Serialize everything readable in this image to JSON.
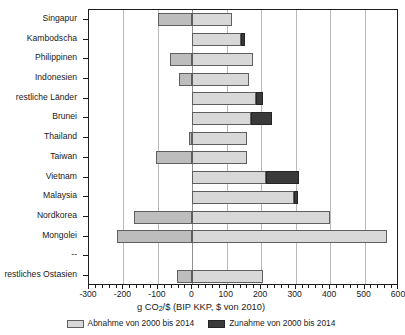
{
  "chart_data": {
    "type": "bar",
    "orientation": "horizontal",
    "title": "",
    "xlabel": "g CO2/$ (BIP KKP, $ von 2010)",
    "xlabel_parts": {
      "pre": "g CO",
      "sub": "2",
      "post": "/$ (BIP KKP, $ von 2010)"
    },
    "ylabel": "",
    "xlim": [
      -300,
      600
    ],
    "xticks": [
      -300,
      -200,
      -100,
      0,
      100,
      200,
      300,
      400,
      500,
      600
    ],
    "xticklabels": [
      "-300",
      "-200",
      "-100",
      "0",
      "100",
      "200",
      "300",
      "400",
      "500",
      "600"
    ],
    "minor_tick_step": 20,
    "grid": true,
    "grid_axis": "x",
    "legend_position": "below",
    "categories": [
      "Singapur",
      "Kambodscha",
      "Philippinen",
      "Indonesien",
      "restliche Länder",
      "Brunei",
      "Thailand",
      "Taiwan",
      "Vietnam",
      "Malaysia",
      "Nordkorea",
      "Mongolei",
      "--",
      "restliches Ostasien"
    ],
    "series": [
      {
        "name": "Abnahme von 2000 bis 2014",
        "color": "#d8d8d8",
        "note": "Balken erstreckt sich von start bis ende (Abnahme-Anteil)",
        "segments": [
          {
            "category": "Singapur",
            "start": -100,
            "end": 115
          },
          {
            "category": "Kambodscha",
            "start": 0,
            "end": 140
          },
          {
            "category": "Philippinen",
            "start": -65,
            "end": 175
          },
          {
            "category": "Indonesien",
            "start": -40,
            "end": 165
          },
          {
            "category": "restliche Länder",
            "start": 0,
            "end": 185
          },
          {
            "category": "Brunei",
            "start": 0,
            "end": 170
          },
          {
            "category": "Thailand",
            "start": -10,
            "end": 160
          },
          {
            "category": "Taiwan",
            "start": -105,
            "end": 160
          },
          {
            "category": "Vietnam",
            "start": 0,
            "end": 215
          },
          {
            "category": "Malaysia",
            "start": 0,
            "end": 295
          },
          {
            "category": "Nordkorea",
            "start": -170,
            "end": 400
          },
          {
            "category": "Mongolei",
            "start": -220,
            "end": 565
          },
          {
            "category": "--",
            "start": 0,
            "end": 0
          },
          {
            "category": "restliches Ostasien",
            "start": -45,
            "end": 205
          }
        ]
      },
      {
        "name": "Zunahme von 2000 bis 2014",
        "color": "#3a3a3a",
        "note": "dunkles Endsegment am rechten Balkenende",
        "segments": [
          {
            "category": "Singapur",
            "start": 0,
            "end": 0
          },
          {
            "category": "Kambodscha",
            "start": 140,
            "end": 152
          },
          {
            "category": "Philippinen",
            "start": 0,
            "end": 0
          },
          {
            "category": "Indonesien",
            "start": 0,
            "end": 0
          },
          {
            "category": "restliche Länder",
            "start": 185,
            "end": 205
          },
          {
            "category": "Brunei",
            "start": 170,
            "end": 232
          },
          {
            "category": "Thailand",
            "start": 0,
            "end": 0
          },
          {
            "category": "Taiwan",
            "start": 0,
            "end": 0
          },
          {
            "category": "Vietnam",
            "start": 215,
            "end": 310
          },
          {
            "category": "Malaysia",
            "start": 295,
            "end": 307
          },
          {
            "category": "Nordkorea",
            "start": 0,
            "end": 0
          },
          {
            "category": "Mongolei",
            "start": 0,
            "end": 0
          },
          {
            "category": "--",
            "start": 0,
            "end": 0
          },
          {
            "category": "restliches Ostasien",
            "start": 0,
            "end": 0
          }
        ]
      }
    ],
    "negative_fill": "#bdbdbd",
    "positive_fill": "#d8d8d8",
    "increase_fill": "#3a3a3a",
    "bar_edge_color": "#5f5f5f"
  },
  "legend": {
    "items": [
      {
        "label": "Abnahme von 2000 bis 2014",
        "swatch": "decrease"
      },
      {
        "label": "Zunahme von 2000 bis 2014",
        "swatch": "increase"
      }
    ]
  },
  "axis": {
    "x_title_pre": "g CO",
    "x_title_sub": "2",
    "x_title_post": "/$ (BIP KKP, $ von 2010)"
  }
}
